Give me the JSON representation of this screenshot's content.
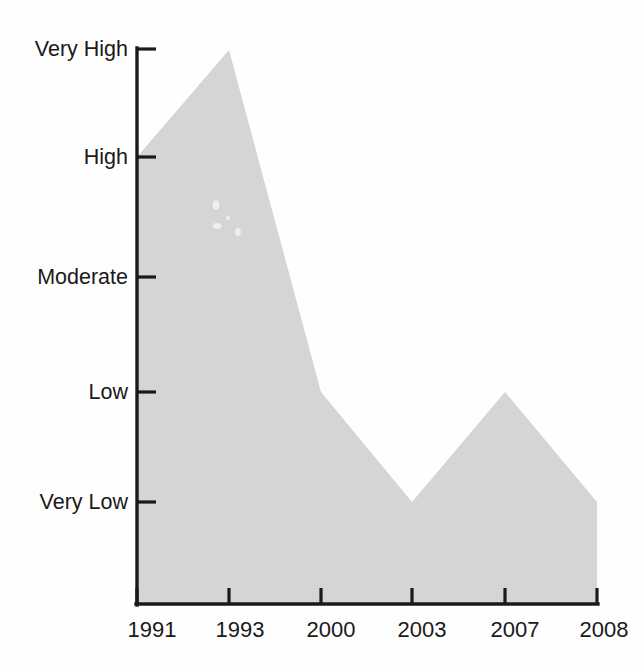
{
  "figure": {
    "cropped_title_fragment": "",
    "background_color": "#fefefe",
    "area_color": "#d5d5d5",
    "axis_color": "#1a1a1a"
  },
  "chart_data": {
    "type": "area",
    "title": "",
    "subtitle": "",
    "xlabel": "",
    "ylabel": "",
    "x": [
      "1991",
      "1993",
      "2000",
      "2003",
      "2007",
      "2008"
    ],
    "categories": [
      "1991",
      "1993",
      "2000",
      "2003",
      "2007",
      "2008"
    ],
    "values": [
      "High",
      "Very High",
      "Low",
      "Very Low",
      "Low",
      "Very Low"
    ],
    "numeric_values": [
      4,
      5,
      2,
      1,
      2,
      1
    ],
    "y_tick_labels": [
      "Very High",
      "High",
      "Moderate",
      "Low",
      "Very Low"
    ],
    "y_tick_values": [
      5,
      4,
      3,
      2,
      1
    ],
    "ylim": [
      1,
      5
    ],
    "grid": false,
    "legend": null,
    "annotations": []
  },
  "axes": {
    "y": {
      "ticks": [
        {
          "label": "Very High",
          "value": 5
        },
        {
          "label": "High",
          "value": 4
        },
        {
          "label": "Moderate",
          "value": 3
        },
        {
          "label": "Low",
          "value": 2
        },
        {
          "label": "Very Low",
          "value": 1
        }
      ]
    },
    "x": {
      "ticks": [
        {
          "label": "1991"
        },
        {
          "label": "1993"
        },
        {
          "label": "2000"
        },
        {
          "label": "2003"
        },
        {
          "label": "2007"
        },
        {
          "label": "2008"
        }
      ]
    }
  }
}
